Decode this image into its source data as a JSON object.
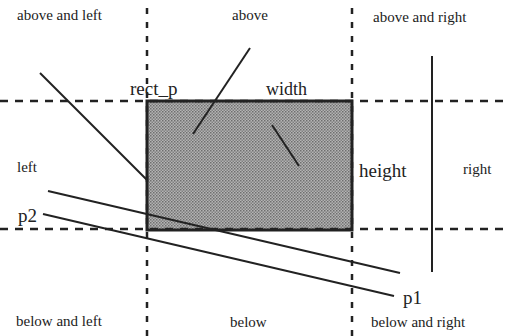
{
  "diagram": {
    "regions": {
      "above_left": "above and left",
      "above": "above",
      "above_right": "above and right",
      "left": "left",
      "right": "right",
      "below_left": "below and left",
      "below": "below",
      "below_right": "below and right"
    },
    "labels": {
      "rect_p": "rect_p",
      "width": "width",
      "height": "height",
      "p1": "p1",
      "p2": "p2"
    },
    "colors": {
      "line": "#222222",
      "rect_fill": "#9a9a9a",
      "background": "#ffffff"
    },
    "rect": {
      "x": 147,
      "y": 101,
      "width": 205,
      "height": 129
    }
  }
}
